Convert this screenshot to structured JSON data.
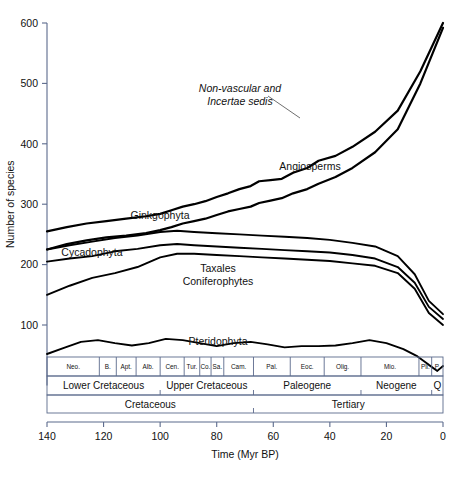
{
  "chart_data": {
    "type": "line",
    "title": "",
    "xlabel": "Time (Myr BP)",
    "ylabel": "Number of species",
    "xlim": [
      140,
      0
    ],
    "ylim": [
      0,
      600
    ],
    "xticks": [
      140,
      120,
      100,
      80,
      60,
      40,
      20,
      0
    ],
    "yticks": [
      100,
      200,
      300,
      400,
      500,
      600
    ],
    "grid": false,
    "legend_position": "inline-annotations",
    "x_axis_reversed": true,
    "series": [
      {
        "name": "Non-vascular and Incertae sedis",
        "label_style": "italic",
        "label_x": 240,
        "label_y": 92,
        "x": [
          140,
          133,
          126,
          119,
          112,
          105,
          100,
          96,
          92,
          88,
          84,
          80,
          76,
          72,
          68,
          65,
          61,
          57,
          53,
          48,
          44,
          38,
          32,
          24,
          16,
          8,
          0
        ],
        "y": [
          255,
          262,
          268,
          272,
          276,
          280,
          284,
          290,
          296,
          300,
          305,
          312,
          318,
          325,
          330,
          338,
          340,
          342,
          352,
          360,
          372,
          380,
          395,
          420,
          455,
          520,
          600
        ]
      },
      {
        "name": "Angiosperms",
        "label_style": "normal",
        "label_x": 310,
        "label_y": 170,
        "x": [
          140,
          133,
          126,
          119,
          112,
          105,
          100,
          96,
          92,
          88,
          84,
          80,
          76,
          72,
          68,
          65,
          61,
          57,
          53,
          48,
          44,
          38,
          32,
          24,
          16,
          8,
          0
        ],
        "y": [
          225,
          234,
          240,
          245,
          248,
          252,
          257,
          262,
          268,
          272,
          276,
          282,
          288,
          292,
          296,
          302,
          306,
          310,
          318,
          325,
          334,
          345,
          360,
          386,
          424,
          500,
          592
        ]
      },
      {
        "name": "Ginkgophyta",
        "label_style": "normal",
        "label_x": 160,
        "label_y": 219,
        "x": [
          140,
          132,
          124,
          116,
          108,
          100,
          94,
          88,
          80,
          72,
          64,
          56,
          48,
          40,
          32,
          24,
          16,
          10,
          5,
          0
        ],
        "y": [
          205,
          210,
          214,
          222,
          226,
          232,
          234,
          232,
          230,
          228,
          226,
          224,
          222,
          220,
          216,
          210,
          196,
          170,
          130,
          110
        ]
      },
      {
        "name": "Cycadophyta",
        "label_style": "normal",
        "label_x": 92,
        "label_y": 256,
        "x": [
          140,
          132,
          124,
          116,
          108,
          100,
          94,
          88,
          80,
          72,
          64,
          56,
          48,
          40,
          32,
          24,
          16,
          10,
          5,
          0
        ],
        "y": [
          150,
          165,
          178,
          186,
          196,
          212,
          218,
          218,
          216,
          214,
          212,
          210,
          208,
          206,
          202,
          198,
          186,
          160,
          120,
          100
        ]
      },
      {
        "name": "Taxales Coniferophytes",
        "label_style": "normal",
        "label_x": 218,
        "label_y": 272,
        "x": [
          140,
          132,
          124,
          116,
          108,
          100,
          94,
          88,
          80,
          72,
          64,
          56,
          48,
          40,
          32,
          24,
          16,
          10,
          5,
          0
        ],
        "y": [
          225,
          232,
          238,
          244,
          248,
          254,
          256,
          254,
          252,
          250,
          248,
          246,
          244,
          241,
          236,
          230,
          214,
          184,
          140,
          118
        ]
      },
      {
        "name": "Pteridophyta",
        "label_style": "normal",
        "label_x": 218,
        "label_y": 345,
        "x": [
          140,
          134,
          128,
          122,
          116,
          110,
          104,
          98,
          92,
          86,
          80,
          74,
          68,
          62,
          56,
          50,
          44,
          38,
          32,
          26,
          20,
          14,
          9,
          5,
          2,
          0
        ],
        "y": [
          52,
          62,
          72,
          75,
          70,
          66,
          70,
          77,
          75,
          70,
          65,
          70,
          72,
          68,
          63,
          65,
          65,
          66,
          70,
          75,
          70,
          60,
          48,
          34,
          24,
          32
        ]
      }
    ],
    "annotation_leaders": [
      {
        "from_x": 268,
        "from_y": 96,
        "to_x": 300,
        "to_y": 118
      }
    ]
  },
  "timescale": {
    "stage_row": [
      {
        "label": "Neo.",
        "start": 140,
        "end": 121.5
      },
      {
        "label": "B.",
        "start": 121.5,
        "end": 115.5
      },
      {
        "label": "Apt.",
        "start": 115.5,
        "end": 108.5
      },
      {
        "label": "Alb.",
        "start": 108.5,
        "end": 100.0
      },
      {
        "label": "Cen.",
        "start": 100.0,
        "end": 91.5
      },
      {
        "label": "Tur.",
        "start": 91.5,
        "end": 86.0
      },
      {
        "label": "Co.",
        "start": 86.0,
        "end": 82.0
      },
      {
        "label": "Sa.",
        "start": 82.0,
        "end": 77.5
      },
      {
        "label": "Cam.",
        "start": 77.5,
        "end": 67.0
      },
      {
        "label": "Pal.",
        "start": 67.0,
        "end": 54.0
      },
      {
        "label": "Eoc.",
        "start": 54.0,
        "end": 42.0
      },
      {
        "label": "Olig.",
        "start": 42.0,
        "end": 29.0
      },
      {
        "label": "Mio.",
        "start": 29.0,
        "end": 8.5
      },
      {
        "label": "Pli.",
        "start": 8.5,
        "end": 4.0
      },
      {
        "label": "P.",
        "start": 4.0,
        "end": 0
      }
    ],
    "epoch_row": [
      {
        "label": "Lower Cretaceous",
        "start": 140,
        "end": 100.0
      },
      {
        "label": "Upper Cretaceous",
        "start": 100.0,
        "end": 67.0
      },
      {
        "label": "Paleogene",
        "start": 67.0,
        "end": 29.0
      },
      {
        "label": "Neogene",
        "start": 29.0,
        "end": 4.0
      },
      {
        "label": "Q",
        "start": 4.0,
        "end": 0
      }
    ],
    "period_row": [
      {
        "label": "Cretaceous",
        "start": 140,
        "end": 67.0
      },
      {
        "label": "Tertiary",
        "start": 67.0,
        "end": 0
      }
    ]
  },
  "colors": {
    "curve": "#000000",
    "axis": "#5b6a8c",
    "text": "#111111",
    "background": "#ffffff"
  }
}
